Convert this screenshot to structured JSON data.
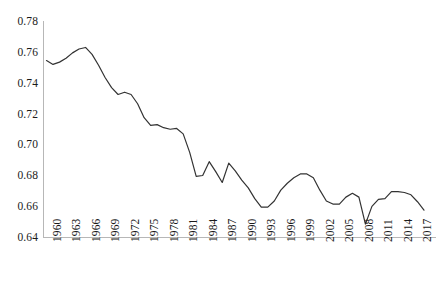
{
  "chart_data": {
    "type": "line",
    "title": "",
    "subtitle": "",
    "xlabel": "",
    "ylabel": "",
    "grid": false,
    "legend": "none",
    "legend_entries": [],
    "annotations": [],
    "line_color": "#333333",
    "axis_color": "#b7b7b7",
    "ylim": [
      0.64,
      0.78
    ],
    "ytick_labels": [
      "0.78",
      "0.76",
      "0.74",
      "0.72",
      "0.70",
      "0.68",
      "0.66",
      "0.64"
    ],
    "ytick_values": [
      0.78,
      0.76,
      0.74,
      0.72,
      0.7,
      0.68,
      0.66,
      0.64
    ],
    "xtick_labels": [
      "1960",
      "1963",
      "1966",
      "1969",
      "1972",
      "1975",
      "1978",
      "1981",
      "1984",
      "1987",
      "1990",
      "1993",
      "1996",
      "1999",
      "2002",
      "2005",
      "2008",
      "2011",
      "2014",
      "2017"
    ],
    "x": [
      1960,
      1961,
      1962,
      1963,
      1964,
      1965,
      1966,
      1967,
      1968,
      1969,
      1970,
      1971,
      1972,
      1973,
      1974,
      1975,
      1976,
      1977,
      1978,
      1979,
      1980,
      1981,
      1982,
      1983,
      1984,
      1985,
      1986,
      1987,
      1988,
      1989,
      1990,
      1991,
      1992,
      1993,
      1994,
      1995,
      1996,
      1997,
      1998,
      1999,
      2000,
      2001,
      2002,
      2003,
      2004,
      2005,
      2006,
      2007,
      2008,
      2009,
      2010,
      2011,
      2012,
      2013,
      2014,
      2015,
      2016,
      2017,
      2018
    ],
    "values": [
      0.755,
      0.7525,
      0.754,
      0.7565,
      0.76,
      0.7625,
      0.7635,
      0.759,
      0.752,
      0.744,
      0.7375,
      0.733,
      0.7345,
      0.733,
      0.727,
      0.718,
      0.713,
      0.7135,
      0.7115,
      0.7105,
      0.711,
      0.7075,
      0.6955,
      0.68,
      0.6805,
      0.6895,
      0.683,
      0.676,
      0.6885,
      0.6835,
      0.6775,
      0.6725,
      0.6655,
      0.66,
      0.66,
      0.664,
      0.671,
      0.6755,
      0.679,
      0.6815,
      0.6815,
      0.679,
      0.671,
      0.664,
      0.662,
      0.662,
      0.6665,
      0.669,
      0.6665,
      0.649,
      0.6605,
      0.665,
      0.6655,
      0.67,
      0.67,
      0.6695,
      0.668,
      0.6635,
      0.658
    ],
    "series": [
      {
        "name": "",
        "values": [
          0.755,
          0.7525,
          0.754,
          0.7565,
          0.76,
          0.7625,
          0.7635,
          0.759,
          0.752,
          0.744,
          0.7375,
          0.733,
          0.7345,
          0.733,
          0.727,
          0.718,
          0.713,
          0.7135,
          0.7115,
          0.7105,
          0.711,
          0.7075,
          0.6955,
          0.68,
          0.6805,
          0.6895,
          0.683,
          0.676,
          0.6885,
          0.6835,
          0.6775,
          0.6725,
          0.6655,
          0.66,
          0.66,
          0.664,
          0.671,
          0.6755,
          0.679,
          0.6815,
          0.6815,
          0.679,
          0.671,
          0.664,
          0.662,
          0.662,
          0.6665,
          0.669,
          0.6665,
          0.649,
          0.6605,
          0.665,
          0.6655,
          0.67,
          0.67,
          0.6695,
          0.668,
          0.6635,
          0.658
        ]
      }
    ]
  }
}
